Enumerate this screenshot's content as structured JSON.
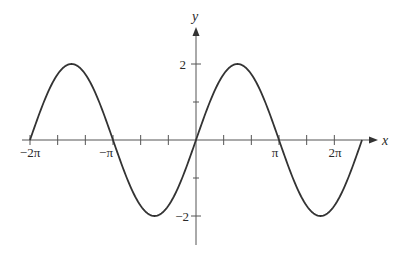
{
  "chart_data": {
    "type": "line",
    "title": "",
    "function": "y = 2 sin x",
    "xlabel": "x",
    "ylabel": "y",
    "xlim": [
      -6.2832,
      6.2832
    ],
    "ylim": [
      -2,
      2
    ],
    "grid": false,
    "legend": null,
    "x_ticks_step": "π/3",
    "x_tick_labels": [
      {
        "label": "−2π",
        "value": -6.2832
      },
      {
        "label": "−π",
        "value": -3.1416
      },
      {
        "label": "π",
        "value": 3.1416
      },
      {
        "label": "2π",
        "value": 5.236
      }
    ],
    "y_tick_labels": [
      {
        "label": "2",
        "value": 2
      },
      {
        "label": "−2",
        "value": -2
      }
    ],
    "series": [
      {
        "name": "2 sin x",
        "x": [
          -6.2832,
          -5.4978,
          -4.7124,
          -3.927,
          -3.1416,
          -2.3562,
          -1.5708,
          -0.7854,
          0,
          0.7854,
          1.5708,
          2.3562,
          3.1416,
          3.927,
          4.7124,
          5.4978,
          6.2832
        ],
        "values": [
          0,
          1.414,
          2,
          1.414,
          0,
          -1.414,
          -2,
          -1.414,
          0,
          1.414,
          2,
          1.414,
          0,
          -1.414,
          -2,
          -1.414,
          0
        ]
      }
    ],
    "colors": {
      "axis": "#555555",
      "curve": "#333333",
      "text": "#2a2a2a"
    }
  },
  "labels": {
    "x_axis": "x",
    "y_axis": "y",
    "neg_two_pi": "−2π",
    "neg_pi": "−π",
    "pi": "π",
    "two_pi": "2π",
    "y_pos_two": "2",
    "y_neg_two": "−2"
  }
}
